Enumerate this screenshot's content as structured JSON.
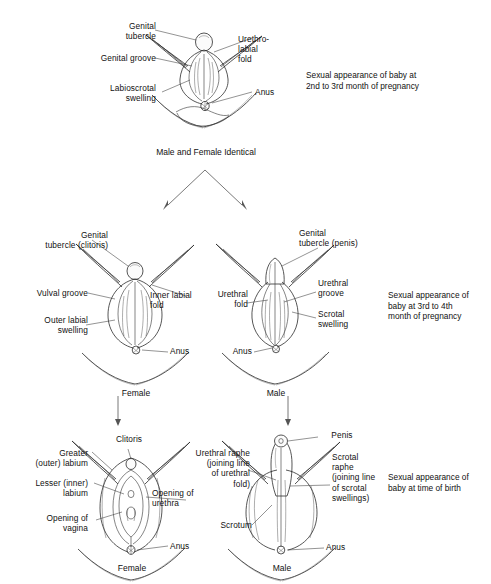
{
  "figure": {
    "background": "#ffffff",
    "ink_color": "#2b2b2b"
  },
  "stage1": {
    "name": "Male and Female Identical",
    "caption": "Sexual appearance of baby at\n2nd to 3rd month of pregnancy",
    "labels": {
      "genital_tubercle": "Genital\ntubercle",
      "genital_groove": "Genital groove",
      "labioscrotal_swelling": "Labioscrotal\nswelling",
      "urethro_labial_fold": "Urethro-\nlabial\nfold",
      "anus": "Anus"
    }
  },
  "stage2": {
    "caption": "Sexual appearance of\nbaby at 3rd to 4th\nmonth of pregnancy",
    "female": {
      "name": "Female",
      "labels": {
        "genital_tubercle": "Genital\ntubercle (clitoris)",
        "vulval_groove": "Vulval groove",
        "outer_labial_swelling": "Outer labial\nswelling",
        "inner_labial_fold": "Inner labial\nfold",
        "anus": "Anus"
      }
    },
    "male": {
      "name": "Male",
      "labels": {
        "genital_tubercle": "Genital\ntubercle (penis)",
        "urethral_fold": "Urethral\nfold",
        "urethral_groove": "Urethral\ngroove",
        "scrotal_swelling": "Scrotal\nswelling",
        "anus": "Anus"
      }
    }
  },
  "stage3": {
    "caption": "Sexual appearance of\nbaby at time of birth",
    "female": {
      "name": "Female",
      "labels": {
        "clitoris": "Clitoris",
        "greater_outer_labium": "Greater\n(outer) labium",
        "lesser_inner_labium": "Lesser (inner)\nlabium",
        "opening_of_vagina": "Opening of\nvagina",
        "opening_of_urethra": "Opening of\nurethra",
        "anus": "Anus"
      }
    },
    "male": {
      "name": "Male",
      "labels": {
        "penis": "Penis",
        "urethral_raphe": "Urethral raphe\n(joining line\nof urethral\nfold)",
        "scrotal_raphe": "Scrotal\nraphe\n(joining line\nof scrotal\nswellings)",
        "scrotum": "Scrotum",
        "anus": "Anus"
      }
    }
  }
}
